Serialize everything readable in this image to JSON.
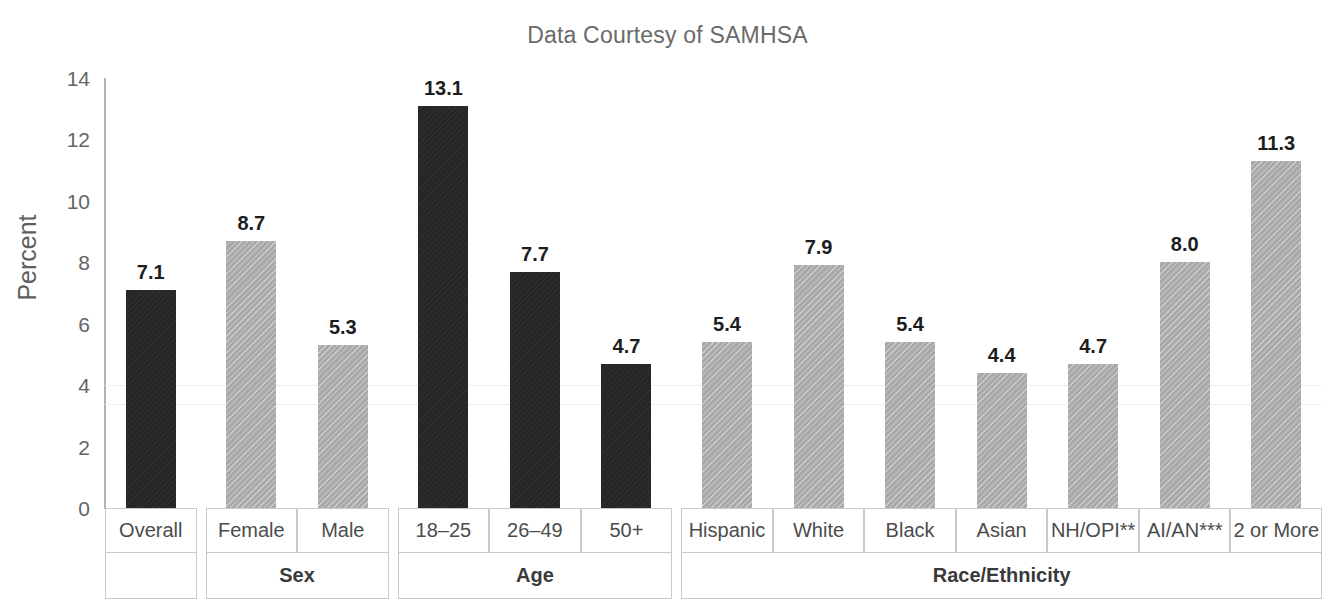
{
  "chart_data": {
    "type": "bar",
    "title": "Data Courtesy of SAMHSA",
    "xlabel": "",
    "ylabel": "Percent",
    "ylim": [
      0,
      14
    ],
    "ytick_step": 2,
    "ytick_labels": [
      "14",
      "12",
      "10",
      "8",
      "6",
      "4",
      "2",
      "0"
    ],
    "grid": false,
    "legend": "none",
    "categories": [
      "Overall",
      "Female",
      "Male",
      "18–25",
      "26–49",
      "50+",
      "Hispanic",
      "White",
      "Black",
      "Asian",
      "NH/OPI**",
      "AI/AN***",
      "2 or More"
    ],
    "values": [
      7.1,
      8.7,
      5.3,
      13.1,
      7.7,
      4.7,
      5.4,
      7.9,
      5.4,
      4.4,
      4.7,
      8.0,
      11.3
    ],
    "value_labels": [
      "7.1",
      "8.7",
      "5.3",
      "13.1",
      "7.7",
      "4.7",
      "5.4",
      "7.9",
      "5.4",
      "4.4",
      "4.7",
      "8.0",
      "11.3"
    ],
    "bar_shades": [
      "dark",
      "light",
      "light",
      "dark",
      "dark",
      "dark",
      "light",
      "light",
      "light",
      "light",
      "light",
      "light",
      "light"
    ],
    "group_headers": [
      "",
      "Sex",
      "Age",
      "Race/Ethnicity"
    ],
    "groups": [
      {
        "label": "",
        "span": 1
      },
      {
        "label": "Sex",
        "span": 2
      },
      {
        "label": "Age",
        "span": 3
      },
      {
        "label": "Race/Ethnicity",
        "span": 7
      }
    ],
    "colors": {
      "dark_bar": "#262626",
      "light_bar": "#a9a9a9",
      "axis": "#b4b4b4",
      "title_text": "#6a6a6a",
      "tick_text": "#656565",
      "table_border": "#c9c9c9"
    }
  }
}
